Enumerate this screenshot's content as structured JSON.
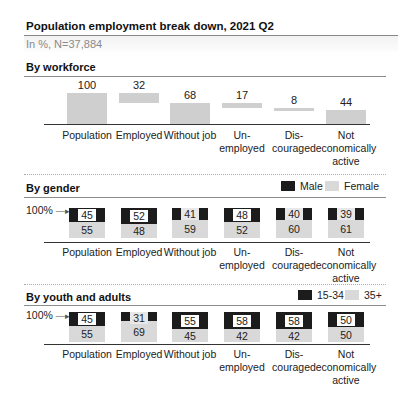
{
  "header": {
    "title": "Population employment break down, 2021 Q2",
    "subtitle": "In %, N=37,884"
  },
  "sections": {
    "workforce": {
      "heading": "By workforce"
    },
    "gender": {
      "heading": "By gender",
      "legend": [
        "Male",
        "Female"
      ],
      "axis_marker": "100%"
    },
    "youth": {
      "heading": "By youth and adults",
      "legend": [
        "15-34",
        "35+"
      ],
      "axis_marker": "100%"
    }
  },
  "categories": [
    [
      "Population"
    ],
    [
      "Employed"
    ],
    [
      "Without job"
    ],
    [
      "Un-",
      "employed"
    ],
    [
      "Dis-",
      "couraged"
    ],
    [
      "Not",
      "economically",
      "active"
    ]
  ],
  "colors": {
    "workforce_bar": "#cfcfcf",
    "dark_series": "#1c1c1c",
    "light_series": "#f0f0f0"
  },
  "chart_data": [
    {
      "type": "bar",
      "subtype": "waterfall",
      "title": "By workforce",
      "categories": [
        "Population",
        "Employed",
        "Without job",
        "Unemployed",
        "Discouraged",
        "Not economically active"
      ],
      "values": [
        100,
        32,
        68,
        17,
        8,
        44
      ],
      "value_labels": [
        "100",
        "32",
        "68",
        "17",
        "8",
        "44"
      ],
      "ylim": [
        0,
        100
      ],
      "grid": false
    },
    {
      "type": "bar",
      "subtype": "stacked-100",
      "title": "By gender",
      "categories": [
        "Population",
        "Employed",
        "Without job",
        "Unemployed",
        "Discouraged",
        "Not economically active"
      ],
      "series": [
        {
          "name": "Male",
          "values": [
            45,
            52,
            41,
            48,
            40,
            39
          ]
        },
        {
          "name": "Female",
          "values": [
            55,
            48,
            59,
            52,
            60,
            61
          ]
        }
      ],
      "ylim": [
        0,
        100
      ],
      "annotations": [
        "100% →"
      ],
      "legend_position": "top-right"
    },
    {
      "type": "bar",
      "subtype": "stacked-100",
      "title": "By youth and adults",
      "categories": [
        "Population",
        "Employed",
        "Without job",
        "Unemployed",
        "Discouraged",
        "Not economically active"
      ],
      "series": [
        {
          "name": "15-34",
          "values": [
            45,
            31,
            55,
            58,
            58,
            50
          ]
        },
        {
          "name": "35+",
          "values": [
            55,
            69,
            45,
            42,
            42,
            50
          ]
        }
      ],
      "ylim": [
        0,
        100
      ],
      "annotations": [
        "100% →"
      ],
      "legend_position": "top-right"
    }
  ]
}
